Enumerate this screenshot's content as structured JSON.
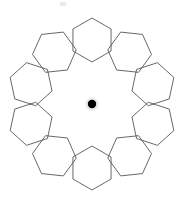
{
  "figure": {
    "background_color": "#ffffff",
    "width": 187,
    "height": 198,
    "stroke_color": "#4d4d4d",
    "stroke_width": 0.85,
    "center_dot_color": "#000000"
  },
  "chart_data": {
    "type": "scatter",
    "subtitle": "",
    "xlabel": "",
    "ylabel": "",
    "xlim": [
      0,
      187
    ],
    "ylim": [
      0,
      198
    ],
    "grid": false,
    "legend": null,
    "center": {
      "label": "center-point",
      "x": 92,
      "y": 104,
      "radius": 4.2,
      "color": "#000000"
    },
    "ring": {
      "count": 10,
      "ring_radius": 64,
      "hexagon_circumradius": 22,
      "angle_step_degrees": 36,
      "start_angle_degrees": -90,
      "orientation": "each hexagon rotated tangentially to its ring angle"
    },
    "hexagons": [
      {
        "id": "hex-1",
        "position": "top",
        "angle_degrees": -90,
        "cx": 92,
        "cy": 40,
        "rotation_degrees": 0,
        "circumradius": 22
      },
      {
        "id": "hex-2",
        "position": "upper-right",
        "angle_degrees": -54,
        "cx": 129.6,
        "cy": 52.2,
        "rotation_degrees": 36,
        "circumradius": 22
      },
      {
        "id": "hex-3",
        "position": "right-upper",
        "angle_degrees": -18,
        "cx": 152.9,
        "cy": 84.2,
        "rotation_degrees": 72,
        "circumradius": 22
      },
      {
        "id": "hex-4",
        "position": "right-lower",
        "angle_degrees": 18,
        "cx": 152.9,
        "cy": 123.8,
        "rotation_degrees": 108,
        "circumradius": 22
      },
      {
        "id": "hex-5",
        "position": "lower-right",
        "angle_degrees": 54,
        "cx": 129.6,
        "cy": 155.8,
        "rotation_degrees": 144,
        "circumradius": 22
      },
      {
        "id": "hex-6",
        "position": "bottom-right",
        "angle_degrees": 90,
        "cx": 92,
        "cy": 168,
        "rotation_degrees": 180,
        "circumradius": 22
      },
      {
        "id": "hex-7",
        "position": "bottom-left",
        "angle_degrees": 126,
        "cx": 54.4,
        "cy": 155.8,
        "rotation_degrees": 216,
        "circumradius": 22
      },
      {
        "id": "hex-8",
        "position": "left-lower",
        "angle_degrees": 162,
        "cx": 31.1,
        "cy": 123.8,
        "rotation_degrees": 252,
        "circumradius": 22
      },
      {
        "id": "hex-9",
        "position": "left-upper",
        "angle_degrees": 198,
        "cx": 31.1,
        "cy": 84.2,
        "rotation_degrees": 288,
        "circumradius": 22
      },
      {
        "id": "hex-10",
        "position": "upper-left",
        "angle_degrees": 234,
        "cx": 54.4,
        "cy": 52.2,
        "rotation_degrees": 324,
        "circumradius": 22
      }
    ],
    "artifacts": [
      {
        "id": "smudge-top",
        "type": "faint-mark",
        "cx": 63,
        "cy": 4,
        "rx": 3.5,
        "ry": 2.0,
        "color": "#e2e2e2"
      }
    ]
  }
}
